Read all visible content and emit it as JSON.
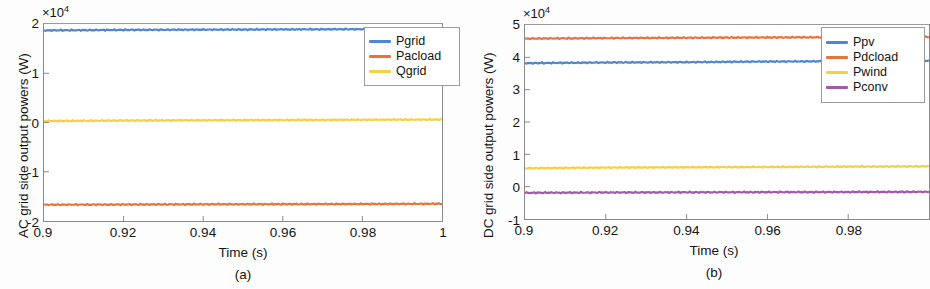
{
  "figure": {
    "background": "#fdfdfd",
    "axis_color": "#8a8a8a",
    "text_color": "#141414"
  },
  "panels": [
    {
      "id": "a",
      "caption": "(a)",
      "exponent_prefix": "×10",
      "exponent_power": "4",
      "chart_data": {
        "type": "line",
        "title": "",
        "xlabel": "Time (s)",
        "ylabel": "AC grid side output powers (W)",
        "xlim": [
          0.9,
          1.0
        ],
        "ylim": [
          -20000,
          20000
        ],
        "y_scale_factor": 10000,
        "y_scale_label": "×10⁴",
        "xticks": [
          0.9,
          0.92,
          0.94,
          0.96,
          0.98,
          1
        ],
        "xticklabels": [
          "0.9",
          "0.92",
          "0.94",
          "0.96",
          "0.98",
          "1"
        ],
        "yticks": [
          -20000,
          -10000,
          0,
          10000,
          20000
        ],
        "yticklabels": [
          "-2",
          "-1",
          "0",
          "1",
          "2"
        ],
        "grid": false,
        "legend_position": "upper right",
        "x": [
          0.9,
          0.92,
          0.94,
          0.96,
          0.98,
          1.0
        ],
        "series": [
          {
            "name": "Pgrid",
            "color": "#4d86d6",
            "values": [
              18700,
              18800,
              18850,
              18900,
              18950,
              19000
            ]
          },
          {
            "name": "Pacload",
            "color": "#e8743b",
            "values": [
              -16700,
              -16650,
              -16600,
              -16580,
              -16550,
              -16500
            ]
          },
          {
            "name": "Qgrid",
            "color": "#f5cf48",
            "values": [
              300,
              400,
              450,
              500,
              550,
              600
            ]
          }
        ]
      }
    },
    {
      "id": "b",
      "caption": "(b)",
      "exponent_prefix": "×10",
      "exponent_power": "4",
      "chart_data": {
        "type": "line",
        "title": "",
        "xlabel": "Time (s)",
        "ylabel": "DC grid side output powers (W)",
        "xlim": [
          0.9,
          1.0
        ],
        "ylim": [
          -10000,
          50000
        ],
        "y_scale_factor": 10000,
        "y_scale_label": "×10⁴",
        "xticks": [
          0.9,
          0.92,
          0.94,
          0.96,
          0.98
        ],
        "xticklabels": [
          "0.9",
          "0.92",
          "0.94",
          "0.96",
          "0.98"
        ],
        "yticks": [
          -10000,
          0,
          10000,
          20000,
          30000,
          40000,
          50000
        ],
        "yticklabels": [
          "-1",
          "0",
          "1",
          "2",
          "3",
          "4",
          "5"
        ],
        "grid": false,
        "legend_position": "upper right",
        "x": [
          0.9,
          0.92,
          0.94,
          0.96,
          0.98,
          1.0
        ],
        "series": [
          {
            "name": "Ppv",
            "color": "#4d86d6",
            "values": [
              38200,
              38400,
              38500,
              38700,
              38800,
              38900
            ]
          },
          {
            "name": "Pdcload",
            "color": "#e8743b",
            "values": [
              45800,
              45950,
              46050,
              46150,
              46250,
              46300
            ]
          },
          {
            "name": "Pwind",
            "color": "#f5cf48",
            "values": [
              5700,
              5900,
              6000,
              6100,
              6200,
              6300
            ]
          },
          {
            "name": "Pconv",
            "color": "#a05aa8",
            "values": [
              -1900,
              -1800,
              -1750,
              -1700,
              -1650,
              -1600
            ]
          }
        ]
      }
    }
  ]
}
